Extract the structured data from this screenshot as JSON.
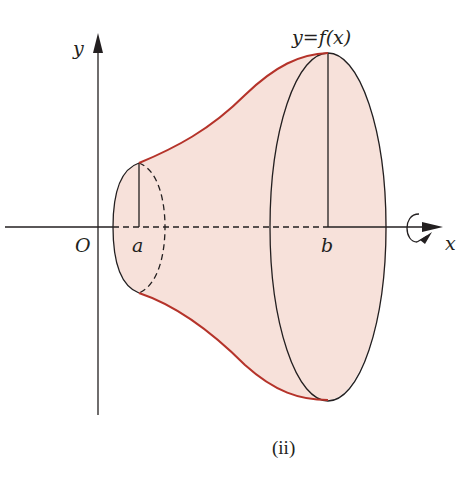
{
  "figure": {
    "caption": "(ii)",
    "function_label": "y=f(x)",
    "axes": {
      "x_label": "x",
      "y_label": "y",
      "origin_label": "O"
    },
    "points": {
      "a_label": "a",
      "b_label": "b"
    },
    "rotation_indicator": "rotation-about-x-axis",
    "colors": {
      "solid_fill": "#f7e1da",
      "curve": "#b5332a",
      "lines": "#231f20"
    }
  }
}
